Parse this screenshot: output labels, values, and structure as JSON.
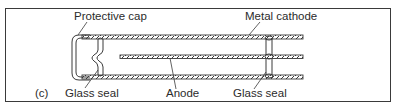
{
  "figure": {
    "panel_label": "(c)",
    "labels": {
      "protective_cap": "Protective cap",
      "metal_cathode": "Metal cathode",
      "glass_seal_left": "Glass seal",
      "anode": "Anode",
      "glass_seal_right": "Glass seal"
    },
    "colors": {
      "line": "#3a3a3a",
      "background": "#ffffff"
    }
  }
}
